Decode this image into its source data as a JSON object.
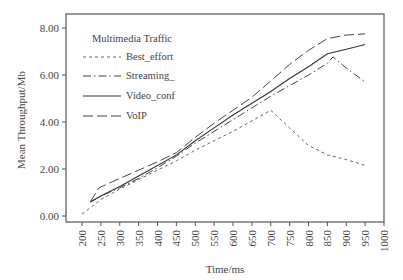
{
  "chart_data": {
    "type": "line",
    "title": "",
    "xlabel": "Time/ms",
    "ylabel": "Mean Throughput/Mb",
    "xlim": [
      200,
      1000
    ],
    "ylim": [
      0,
      8
    ],
    "grid": false,
    "legend_position": "upper-left",
    "legend_title": "Multimedia Traffic",
    "x_ticks": [
      "200",
      "250",
      "300",
      "350",
      "400",
      "450",
      "500",
      "550",
      "600",
      "650",
      "700",
      "750",
      "800",
      "850",
      "900",
      "950",
      "1000"
    ],
    "y_ticks": [
      "0.00",
      "2.00",
      "4.00",
      "6.00",
      "8.00"
    ],
    "series": [
      {
        "name": "Best_effort",
        "style": "dashed",
        "x": [
          200,
          250,
          300,
          350,
          400,
          450,
          500,
          550,
          600,
          650,
          700,
          750,
          800,
          850,
          900,
          950
        ],
        "y": [
          0.08,
          0.7,
          1.15,
          1.55,
          1.95,
          2.35,
          2.8,
          3.2,
          3.6,
          4.05,
          4.5,
          3.75,
          3.0,
          2.6,
          2.4,
          2.15
        ]
      },
      {
        "name": "Streaming_",
        "style": "dash-dot",
        "x": [
          222,
          250,
          300,
          350,
          400,
          450,
          500,
          550,
          600,
          650,
          700,
          750,
          800,
          850,
          865,
          900,
          950
        ],
        "y": [
          0.6,
          0.85,
          1.2,
          1.6,
          2.05,
          2.55,
          3.1,
          3.6,
          4.1,
          4.6,
          5.1,
          5.55,
          6.0,
          6.5,
          6.77,
          6.3,
          5.7
        ]
      },
      {
        "name": "Video_conf",
        "style": "solid",
        "x": [
          222,
          250,
          300,
          350,
          400,
          450,
          500,
          550,
          600,
          650,
          700,
          750,
          800,
          850,
          900,
          950
        ],
        "y": [
          0.6,
          0.85,
          1.25,
          1.7,
          2.15,
          2.6,
          3.2,
          3.75,
          4.3,
          4.8,
          5.3,
          5.85,
          6.35,
          6.9,
          7.1,
          7.3
        ]
      },
      {
        "name": "VoIP",
        "style": "long-dash",
        "x": [
          222,
          245,
          300,
          350,
          400,
          450,
          500,
          550,
          600,
          650,
          700,
          750,
          800,
          850,
          900,
          950
        ],
        "y": [
          0.6,
          1.2,
          1.6,
          1.95,
          2.3,
          2.7,
          3.35,
          3.95,
          4.5,
          5.05,
          5.75,
          6.45,
          7.05,
          7.55,
          7.7,
          7.75
        ]
      }
    ]
  },
  "legend": {
    "title": "Multimedia Traffic",
    "items": [
      "Best_effort",
      "Streaming_",
      "Video_conf",
      "VoIP"
    ]
  }
}
